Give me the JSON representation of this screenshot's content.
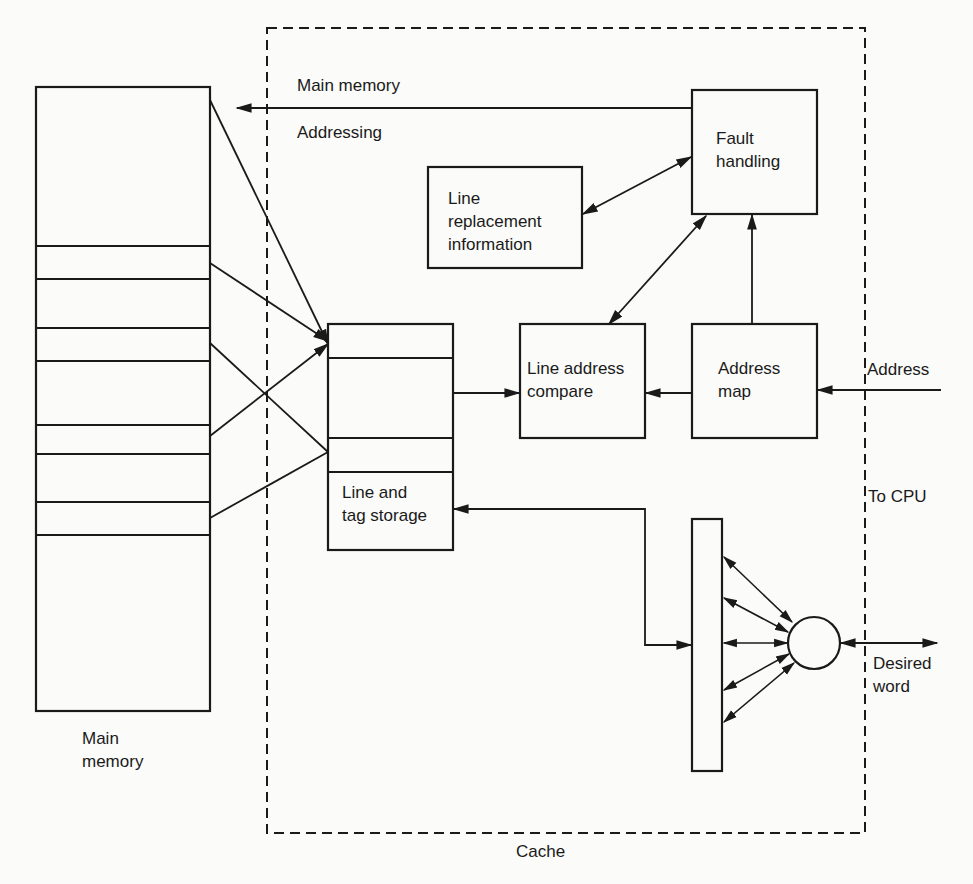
{
  "diagram": {
    "cache_label": "Cache",
    "main_memory_label": "Main\nmemory",
    "blocks": {
      "fault_handling": "Fault\nhandling",
      "line_replacement": "Line\nreplacement\ninformation",
      "line_address_compare": "Line address\ncompare",
      "address_map": "Address\nmap",
      "line_tag_storage": "Line and\ntag storage"
    },
    "signals": {
      "main_memory_addressing_top": "Main memory",
      "main_memory_addressing_bottom": "Addressing",
      "address_in": "Address",
      "to_cpu": "To CPU",
      "desired_word": "Desired\nword"
    },
    "colors": {
      "ink": "#1a1a1a",
      "paper": "#fbfbf9"
    }
  }
}
